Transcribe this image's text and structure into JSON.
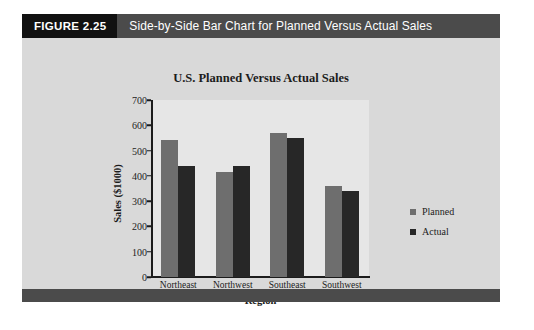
{
  "figure": {
    "number_label": "FIGURE 2.25",
    "caption": "Side-by-Side Bar Chart for Planned Versus Actual Sales",
    "number_block_color": "#111111",
    "caption_block_color": "#4b4b4b",
    "panel_color": "#d9d9d9",
    "plot_background_color": "#e6e6e6"
  },
  "chart_data": {
    "type": "bar",
    "title": "U.S. Planned Versus Actual Sales",
    "xlabel": "Region",
    "ylabel": "Sales ($1000)",
    "categories": [
      "Northeast",
      "Northwest",
      "Southeast",
      "Southwest"
    ],
    "series": [
      {
        "name": "Planned",
        "color": "#6e6e6e",
        "values": [
          540,
          415,
          570,
          360
        ]
      },
      {
        "name": "Actual",
        "color": "#272727",
        "values": [
          440,
          440,
          550,
          340
        ]
      }
    ],
    "ylim": [
      0,
      700
    ],
    "yticks": [
      0,
      100,
      200,
      300,
      400,
      500,
      600,
      700
    ],
    "ytick_labels": [
      "0",
      "100",
      "200",
      "300",
      "400",
      "500",
      "600",
      "700"
    ],
    "grid": false,
    "legend_position": "right"
  }
}
